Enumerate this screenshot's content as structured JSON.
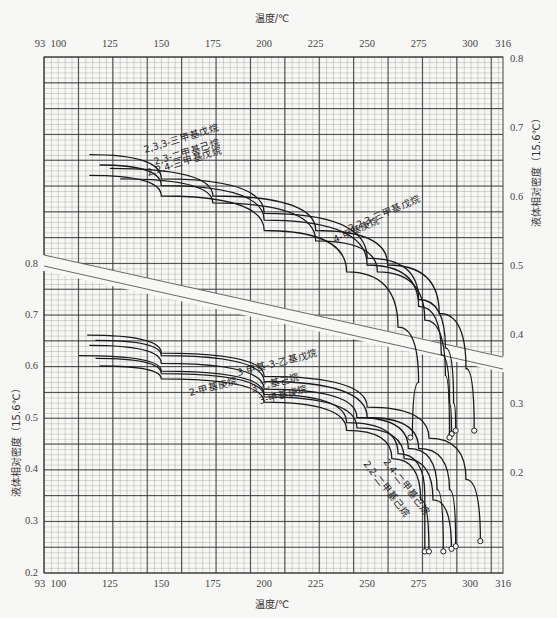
{
  "chart_data": {
    "type": "line",
    "title": "",
    "top_axis": {
      "label": "温度/℃",
      "ticks": [
        93,
        100,
        125,
        150,
        175,
        200,
        225,
        250,
        275,
        300,
        316
      ],
      "range": [
        93,
        316
      ]
    },
    "bottom_axis": {
      "label": "温度/℃",
      "ticks": [
        93,
        100,
        125,
        150,
        175,
        200,
        225,
        250,
        275,
        300,
        316
      ],
      "range": [
        93,
        316
      ]
    },
    "right_axis": {
      "label": "液体相对密度（15.6℃）",
      "ticks": [
        0.8,
        0.7,
        0.6,
        0.5,
        0.4,
        0.3,
        0.2
      ],
      "range": [
        0.2,
        0.8
      ]
    },
    "left_axis": {
      "label": "液体相对密度（15.6℃）",
      "ticks": [
        0.8,
        0.7,
        0.6,
        0.5,
        0.4,
        0.3,
        0.2
      ],
      "range": [
        0.2,
        0.8
      ]
    },
    "grid": true,
    "upper_group_axis": "right",
    "lower_group_axis": "left",
    "series_upper": [
      {
        "name": "2,3,3-三甲基戊烷",
        "points": [
          [
            115,
            0.66
          ],
          [
            150,
            0.625
          ],
          [
            200,
            0.575
          ],
          [
            250,
            0.51
          ],
          [
            275,
            0.45
          ],
          [
            288,
            0.38
          ],
          [
            292,
            0.3
          ],
          [
            293,
            0.26
          ]
        ],
        "critical_point": [
          293,
          0.26
        ]
      },
      {
        "name": "2,3-二甲基己烷",
        "points": [
          [
            120,
            0.645
          ],
          [
            150,
            0.615
          ],
          [
            200,
            0.565
          ],
          [
            250,
            0.5
          ],
          [
            275,
            0.44
          ],
          [
            286,
            0.37
          ],
          [
            290,
            0.3
          ],
          [
            291,
            0.255
          ]
        ],
        "critical_point": [
          291,
          0.255
        ]
      },
      {
        "name": "2,2,4-三甲基戊烷",
        "points": [
          [
            115,
            0.63
          ],
          [
            150,
            0.6
          ],
          [
            200,
            0.55
          ],
          [
            240,
            0.49
          ],
          [
            265,
            0.41
          ],
          [
            275,
            0.33
          ],
          [
            272,
            0.25
          ]
        ],
        "critical_point": [
          271,
          0.25
        ]
      },
      {
        "name": "2,2,3-三甲基戊烷",
        "points": [
          [
            125,
            0.64
          ],
          [
            175,
            0.6
          ],
          [
            225,
            0.55
          ],
          [
            260,
            0.5
          ],
          [
            285,
            0.43
          ],
          [
            298,
            0.35
          ],
          [
            302,
            0.26
          ]
        ],
        "critical_point": [
          302,
          0.26
        ]
      },
      {
        "name": "4-甲基庚烷",
        "points": [
          [
            130,
            0.625
          ],
          [
            175,
            0.59
          ],
          [
            225,
            0.535
          ],
          [
            255,
            0.49
          ],
          [
            278,
            0.42
          ],
          [
            288,
            0.34
          ],
          [
            290,
            0.25
          ]
        ],
        "critical_point": [
          290,
          0.25
        ]
      }
    ],
    "series_lower": [
      {
        "name": "3-甲基-3-乙基戊烷",
        "points": [
          [
            114,
            0.66
          ],
          [
            150,
            0.625
          ],
          [
            200,
            0.58
          ],
          [
            250,
            0.52
          ],
          [
            280,
            0.46
          ],
          [
            298,
            0.38
          ],
          [
            305,
            0.26
          ]
        ],
        "critical_point": [
          305,
          0.26
        ]
      },
      {
        "name": "3-乙基己烷",
        "points": [
          [
            118,
            0.65
          ],
          [
            150,
            0.62
          ],
          [
            200,
            0.57
          ],
          [
            250,
            0.5
          ],
          [
            275,
            0.44
          ],
          [
            290,
            0.36
          ],
          [
            293,
            0.25
          ]
        ],
        "critical_point": [
          293,
          0.25
        ]
      },
      {
        "name": "2-甲基庚烷",
        "points": [
          [
            110,
            0.62
          ],
          [
            150,
            0.59
          ],
          [
            200,
            0.545
          ],
          [
            240,
            0.49
          ],
          [
            265,
            0.43
          ],
          [
            278,
            0.35
          ],
          [
            278,
            0.24
          ]
        ],
        "critical_point": [
          278,
          0.24
        ]
      },
      {
        "name": "3-甲基庚烷",
        "points": [
          [
            115,
            0.64
          ],
          [
            150,
            0.605
          ],
          [
            200,
            0.555
          ],
          [
            245,
            0.5
          ],
          [
            270,
            0.44
          ],
          [
            284,
            0.36
          ],
          [
            287,
            0.24
          ]
        ],
        "critical_point": [
          287,
          0.24
        ]
      },
      {
        "name": "2,4-二甲基己烷",
        "points": [
          [
            118,
            0.615
          ],
          [
            150,
            0.585
          ],
          [
            200,
            0.54
          ],
          [
            245,
            0.48
          ],
          [
            268,
            0.42
          ],
          [
            282,
            0.34
          ],
          [
            291,
            0.245
          ]
        ],
        "critical_point": [
          291,
          0.245
        ]
      },
      {
        "name": "2,2-二甲基己烷",
        "points": [
          [
            120,
            0.6
          ],
          [
            150,
            0.575
          ],
          [
            200,
            0.53
          ],
          [
            240,
            0.475
          ],
          [
            262,
            0.42
          ],
          [
            276,
            0.34
          ],
          [
            280,
            0.24
          ]
        ],
        "critical_point": [
          280,
          0.24
        ]
      }
    ]
  },
  "labels": {
    "top_axis_title": "温度/℃",
    "bottom_axis_title": "温度/℃",
    "right_axis_title": "液体相对密度（15.6℃）",
    "left_axis_title": "液体相对密度（15.6℃）",
    "x_ticks": [
      "93",
      "100",
      "125",
      "150",
      "175",
      "200",
      "225",
      "250",
      "275",
      "300",
      "316"
    ],
    "y_ticks": [
      "0.8",
      "0.7",
      "0.6",
      "0.5",
      "0.4",
      "0.3",
      "0.2"
    ],
    "upper_curves": [
      "2,3,3-三甲基戊烷",
      "2,3-二甲基己烷",
      "2,2,4-三甲基戊烷",
      "2,2,3-三甲基戊烷",
      "4-甲基庚烷"
    ],
    "lower_curves": [
      "3-甲基-3-乙基戊烷",
      "2-甲基庚烷",
      "3-乙基己烷",
      "3-甲基庚烷",
      "2,4-二甲基己烷",
      "2,2-二甲基己烷"
    ]
  },
  "colors": {
    "background": "#f7f7f5",
    "grid": "#555555",
    "curve": "#1a1a1a",
    "band": "#f7f7f5"
  }
}
